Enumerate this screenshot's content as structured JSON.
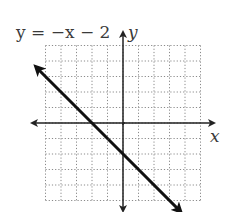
{
  "chart_data": {
    "type": "line",
    "title": "y = −x − 2",
    "xlabel": "x",
    "ylabel": "y",
    "xlim": [
      -5,
      5
    ],
    "ylim": [
      -5,
      5
    ],
    "grid": true,
    "grid_style": "dotted",
    "series": [
      {
        "name": "y = −x − 2",
        "x": [
          -5.6,
          -2,
          0,
          3.7
        ],
        "y": [
          3.6,
          0,
          -2,
          -5.7
        ],
        "slope": -1,
        "intercept": -2,
        "arrows": "both-ends"
      }
    ],
    "key_points": [
      {
        "label": "x-intercept",
        "x": -2,
        "y": 0
      },
      {
        "label": "y-intercept",
        "x": 0,
        "y": -2
      }
    ]
  },
  "labels": {
    "equation": "y = −x − 2",
    "x_axis": "x",
    "y_axis": "y"
  },
  "colors": {
    "line": "#111111",
    "axes": "#222222",
    "grid": "#8a8a8a",
    "text": "#3a3a3a"
  }
}
